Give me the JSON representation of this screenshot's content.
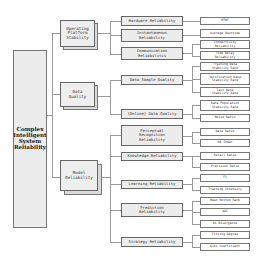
{
  "diagram": {
    "type": "hierarchy-tree",
    "root": {
      "label": "Complex Intelligent System Reliability"
    },
    "level1": [
      {
        "label": "Operating Platform Stability"
      },
      {
        "label": "Data Quality"
      },
      {
        "label": "Model Reliability"
      }
    ],
    "level2": [
      {
        "label": "Hardware Reliability",
        "parent": "Operating Platform Stability"
      },
      {
        "label": "Instantaneous Reliability",
        "parent": "Operating Platform Stability"
      },
      {
        "label": "Communication Reliabilitis",
        "parent": "Operating Platform Stability"
      },
      {
        "label": "Data Sample Quality",
        "parent": "Data Quality"
      },
      {
        "label": "(Online) Data Quality",
        "parent": "Data Quality"
      },
      {
        "label": "Perceptual Recognition Reliability",
        "parent": "Model Reliability"
      },
      {
        "label": "Knowledge Reliability",
        "parent": "Model Reliability"
      },
      {
        "label": "Learning Reliability",
        "parent": "Model Reliability"
      },
      {
        "label": "Prediction Reliability",
        "parent": "Model Reliability"
      },
      {
        "label": "Strategy Reliability",
        "parent": "Model Reliability"
      }
    ],
    "level3": [
      {
        "label": "MTBF",
        "parent": "Hardware Reliability"
      },
      {
        "label": "Average Downtime",
        "parent": "Instantaneous Reliability"
      },
      {
        "label": "Connectivity Reliability",
        "parent": "Communication Reliabilitis"
      },
      {
        "label": "Time Delay Reliability",
        "parent": "Communication Reliabilitis"
      },
      {
        "label": "Training Data Stability Rate",
        "parent": "Data Sample Quality"
      },
      {
        "label": "Verification Data Stability Rate",
        "parent": "Data Sample Quality"
      },
      {
        "label": "Test Data Stability Rate",
        "parent": "Data Sample Quality"
      },
      {
        "label": "Data Population Stability Rate",
        "parent": "(Online) Data Quality"
      },
      {
        "label": "Noise Ratio",
        "parent": "(Online) Data Quality"
      },
      {
        "label": "Data Ratio",
        "parent": "Perceptual Recognition Reliability"
      },
      {
        "label": "DB Index",
        "parent": "Perceptual Recognition Reliability"
      },
      {
        "label": "Recall Ratio",
        "parent": "Knowledge Reliability"
      },
      {
        "label": "Precision Ratio",
        "parent": "Knowledge Reliability"
      },
      {
        "label": "F1",
        "parent": "Learning Reliability"
      },
      {
        "label": "Training Intensity",
        "parent": "Learning Reliability"
      },
      {
        "label": "Mean Bottom Rank",
        "parent": "Prediction Reliability"
      },
      {
        "label": "AUC",
        "parent": "Prediction Reliability"
      },
      {
        "label": "KL Divergence",
        "parent": "Prediction Reliability"
      },
      {
        "label": "Fitting Degree",
        "parent": "Strategy Reliability"
      },
      {
        "label": "Gini Coefficient",
        "parent": "Strategy Reliability"
      }
    ]
  }
}
